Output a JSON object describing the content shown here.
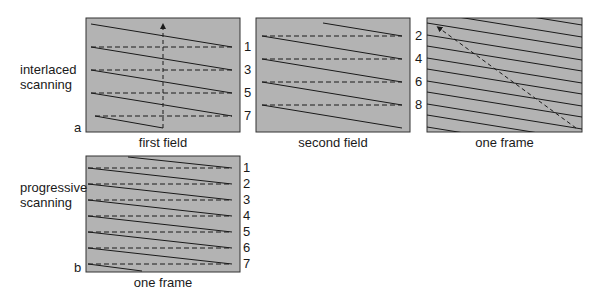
{
  "interlaced": {
    "label_line1": "interlaced",
    "label_line2": "scanning",
    "tag": "a",
    "panels": [
      {
        "caption": "first field",
        "line_numbers": [
          "1",
          "3",
          "5",
          "7"
        ]
      },
      {
        "caption": "second field",
        "line_numbers": [
          "2",
          "4",
          "6",
          "8"
        ]
      },
      {
        "caption": "one frame"
      }
    ]
  },
  "progressive": {
    "label_line1": "progressive",
    "label_line2": "scanning",
    "tag": "b",
    "panel": {
      "caption": "one frame",
      "line_numbers": [
        "1",
        "2",
        "3",
        "4",
        "5",
        "6",
        "7"
      ]
    }
  },
  "colors": {
    "panel_fill": "#b3b3b3",
    "line": "#1a1a1a",
    "background": "#ffffff"
  }
}
